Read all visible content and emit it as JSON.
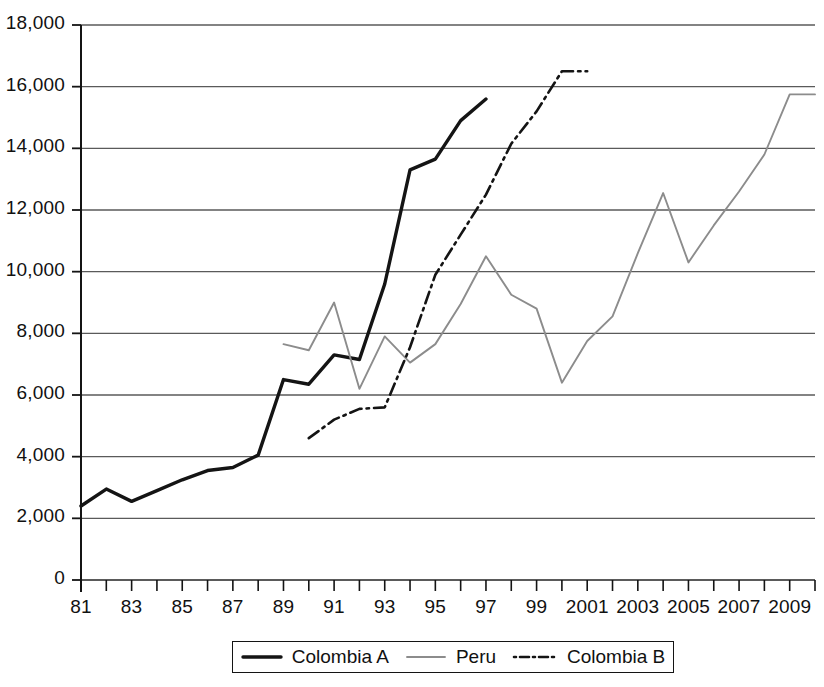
{
  "chart_data": {
    "type": "line",
    "title": "",
    "xlabel": "",
    "ylabel": "",
    "xlim": [
      1981,
      2010
    ],
    "ylim": [
      0,
      18000
    ],
    "grid": true,
    "grid_axis": "y",
    "legend_position": "bottom",
    "y_ticks": [
      0,
      2000,
      4000,
      6000,
      8000,
      10000,
      12000,
      14000,
      16000,
      18000
    ],
    "y_tick_labels": [
      "0",
      "2,000",
      "4,000",
      "6,000",
      "8,000",
      "10,000",
      "12,000",
      "14,000",
      "16,000",
      "18,000"
    ],
    "x_ticks": [
      1981,
      1983,
      1985,
      1987,
      1989,
      1991,
      1993,
      1995,
      1997,
      1999,
      2001,
      2003,
      2005,
      2007,
      2009
    ],
    "x_tick_labels": [
      "81",
      "83",
      "85",
      "87",
      "89",
      "91",
      "93",
      "95",
      "97",
      "99",
      "2001",
      "2003",
      "2005",
      "2007",
      "2009"
    ],
    "x_minor_ticks": [
      1982,
      1984,
      1986,
      1988,
      1990,
      1992,
      1994,
      1996,
      1998,
      2000,
      2002,
      2004,
      2006,
      2008,
      2010
    ],
    "series": [
      {
        "name": "Colombia A",
        "style": "solid-thick",
        "color": "#141414",
        "width": 3.4,
        "x": [
          1981,
          1982,
          1983,
          1984,
          1985,
          1986,
          1987,
          1988,
          1989,
          1990,
          1991,
          1992,
          1993,
          1994,
          1995,
          1996,
          1997
        ],
        "values": [
          2400,
          2950,
          2550,
          2900,
          3250,
          3550,
          3650,
          4050,
          6500,
          6350,
          7300,
          7150,
          9600,
          13300,
          13650,
          14900,
          15600
        ]
      },
      {
        "name": "Peru",
        "style": "solid-thin",
        "color": "#8c8c8c",
        "width": 1.9,
        "x": [
          1989,
          1990,
          1991,
          1992,
          1993,
          1994,
          1995,
          1996,
          1997,
          1998,
          1999,
          2000,
          2001,
          2002,
          2003,
          2004,
          2005,
          2006,
          2007,
          2008,
          2009,
          2010
        ],
        "values": [
          7650,
          7450,
          9000,
          6200,
          7900,
          7050,
          7650,
          8950,
          10500,
          9250,
          8800,
          6400,
          7750,
          8550,
          10600,
          12550,
          10300,
          11500,
          12600,
          13800,
          15750,
          15750
        ]
      },
      {
        "name": "Colombia B",
        "style": "dashdot",
        "color": "#141414",
        "width": 2.6,
        "x": [
          1990,
          1991,
          1992,
          1993,
          1994,
          1995,
          1996,
          1997,
          1998,
          1999,
          2000,
          2001
        ],
        "values": [
          4600,
          5200,
          5550,
          5600,
          7550,
          9900,
          11200,
          12500,
          14150,
          15200,
          16500,
          16500
        ]
      }
    ]
  },
  "legend": {
    "entries": [
      {
        "label": "Colombia A",
        "style": "solid-thick",
        "color": "#141414"
      },
      {
        "label": "Peru",
        "style": "solid-thin",
        "color": "#8c8c8c"
      },
      {
        "label": "Colombia B",
        "style": "dashdot",
        "color": "#141414"
      }
    ]
  },
  "axes": {
    "axis_color": "#141414",
    "grid_color": "#5a5a5a"
  }
}
